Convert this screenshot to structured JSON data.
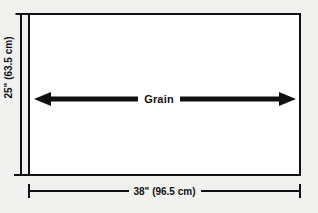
{
  "diagram": {
    "colors": {
      "background": "#f1f1ef",
      "panel_fill": "#ffffff",
      "ink": "#111111"
    },
    "panel": {
      "name": "panel-rectangle"
    },
    "grain": {
      "label": "Grain",
      "arrow_name": "grain-direction-double-arrow",
      "direction": "horizontal-bidirectional"
    },
    "dimensions": {
      "height": {
        "label": "25\" (63.5 cm)",
        "inches": 25,
        "centimeters": 63.5
      },
      "width": {
        "label": "38\" (96.5 cm)",
        "inches": 38,
        "centimeters": 96.5
      }
    }
  }
}
